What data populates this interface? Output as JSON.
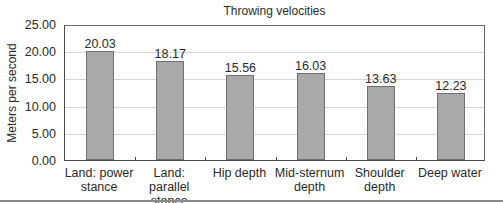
{
  "chart_data": {
    "type": "bar",
    "title": "Throwing velocities",
    "xlabel": "",
    "ylabel": "Meters per second",
    "ylim": [
      0,
      25
    ],
    "yticks": [
      "0.00",
      "5.00",
      "10.00",
      "15.00",
      "20.00",
      "25.00"
    ],
    "grid": true,
    "legend": null,
    "categories": [
      "Land: power stance",
      "Land: parallel stance",
      "Hip depth",
      "Mid-sternum depth",
      "Shoulder depth",
      "Deep water"
    ],
    "category_lines": [
      [
        "Land: power",
        "stance"
      ],
      [
        "Land: parallel",
        "stance"
      ],
      [
        "Hip depth"
      ],
      [
        "Mid-sternum",
        "depth"
      ],
      [
        "Shoulder",
        "depth"
      ],
      [
        "Deep water"
      ]
    ],
    "values": [
      20.03,
      18.17,
      15.56,
      16.03,
      13.63,
      12.23
    ],
    "value_labels": [
      "20.03",
      "18.17",
      "15.56",
      "16.03",
      "13.63",
      "12.23"
    ],
    "colors": {
      "bar": "#a9a9a9",
      "bar_border": "#707070",
      "grid": "#d7d7d7",
      "axis": "#4a4a4a"
    }
  }
}
